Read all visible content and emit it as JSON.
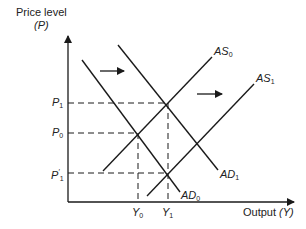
{
  "diagram": {
    "type": "AD-AS economics diagram",
    "y_axis": {
      "label": "Price level",
      "symbol": "(P)"
    },
    "x_axis": {
      "label": "Output",
      "symbol": "(Y)"
    },
    "price_levels": [
      {
        "id": "P1",
        "base": "P",
        "sub": "1",
        "prime": "",
        "y": 103
      },
      {
        "id": "P0",
        "base": "P",
        "sub": "0",
        "prime": "",
        "y": 133
      },
      {
        "id": "P1prime",
        "base": "P",
        "sub": "1",
        "prime": "′",
        "y": 173
      }
    ],
    "output_levels": [
      {
        "id": "Y0",
        "base": "Y",
        "sub": "0",
        "x": 138
      },
      {
        "id": "Y1",
        "base": "Y",
        "sub": "1",
        "x": 168
      }
    ],
    "curves": [
      {
        "id": "AD0",
        "base": "AD",
        "sub": "0",
        "x1": 82,
        "y1": 60,
        "x2": 180,
        "y2": 192
      },
      {
        "id": "AD1",
        "base": "AD",
        "sub": "1",
        "x1": 118,
        "y1": 45,
        "x2": 218,
        "y2": 170
      },
      {
        "id": "AS0",
        "base": "AS",
        "sub": "0",
        "x1": 103,
        "y1": 171,
        "x2": 212,
        "y2": 57
      },
      {
        "id": "AS1",
        "base": "AS",
        "sub": "1",
        "x1": 147,
        "y1": 196,
        "x2": 254,
        "y2": 84
      }
    ],
    "shift_arrows": [
      {
        "id": "AD-shift",
        "direction": "right",
        "x1": 100,
        "y1": 71,
        "x2": 124,
        "y2": 71
      },
      {
        "id": "AS-shift",
        "direction": "right",
        "x1": 197,
        "y1": 94,
        "x2": 222,
        "y2": 94
      }
    ],
    "colors": {
      "line": "#1a1a1a",
      "background": "#ffffff"
    }
  }
}
